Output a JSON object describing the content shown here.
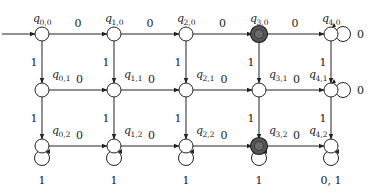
{
  "diagram": {
    "type": "finite_automaton_grid",
    "columns_x": [
      42,
      114,
      186,
      259,
      331
    ],
    "rows_y": [
      34,
      90,
      146
    ],
    "node_radius": 7,
    "colors": {
      "stroke": "#222222",
      "accept_fill": "#555555",
      "normal_fill": "#ffffff"
    },
    "start_state": "q0,0",
    "states": [
      {
        "id": "q00",
        "name": "q",
        "sub": "0,0",
        "col": 0,
        "row": 0,
        "accepting": false
      },
      {
        "id": "q10",
        "name": "q",
        "sub": "1,0",
        "col": 1,
        "row": 0,
        "accepting": false
      },
      {
        "id": "q20",
        "name": "q",
        "sub": "2,0",
        "col": 2,
        "row": 0,
        "accepting": false
      },
      {
        "id": "q30",
        "name": "q",
        "sub": "3,0",
        "col": 3,
        "row": 0,
        "accepting": true
      },
      {
        "id": "q40",
        "name": "q",
        "sub": "4,0",
        "col": 4,
        "row": 0,
        "accepting": false
      },
      {
        "id": "q01",
        "name": "q",
        "sub": "0,1",
        "col": 0,
        "row": 1,
        "accepting": false
      },
      {
        "id": "q11",
        "name": "q",
        "sub": "1,1",
        "col": 1,
        "row": 1,
        "accepting": false
      },
      {
        "id": "q21",
        "name": "q",
        "sub": "2,1",
        "col": 2,
        "row": 1,
        "accepting": false
      },
      {
        "id": "q31",
        "name": "q",
        "sub": "3,1",
        "col": 3,
        "row": 1,
        "accepting": false
      },
      {
        "id": "q41",
        "name": "q",
        "sub": "4,1",
        "col": 4,
        "row": 1,
        "accepting": false
      },
      {
        "id": "q02",
        "name": "q",
        "sub": "0,2",
        "col": 0,
        "row": 2,
        "accepting": false
      },
      {
        "id": "q12",
        "name": "q",
        "sub": "1,2",
        "col": 1,
        "row": 2,
        "accepting": false
      },
      {
        "id": "q22",
        "name": "q",
        "sub": "2,2",
        "col": 2,
        "row": 2,
        "accepting": false
      },
      {
        "id": "q32",
        "name": "q",
        "sub": "3,2",
        "col": 3,
        "row": 2,
        "accepting": true
      },
      {
        "id": "q42",
        "name": "q",
        "sub": "4,2",
        "col": 4,
        "row": 2,
        "accepting": false
      }
    ],
    "horizontal_label": "0",
    "vertical_label": "1",
    "self_loops": [
      {
        "state": "q40",
        "label": "0",
        "side": "right"
      },
      {
        "state": "q41",
        "label": "0",
        "side": "right"
      },
      {
        "state": "q02",
        "label": "1",
        "side": "below"
      },
      {
        "state": "q12",
        "label": "1",
        "side": "below"
      },
      {
        "state": "q22",
        "label": "1",
        "side": "below"
      },
      {
        "state": "q32",
        "label": "1",
        "side": "below"
      },
      {
        "state": "q42",
        "label": "0, 1",
        "side": "below"
      }
    ]
  }
}
